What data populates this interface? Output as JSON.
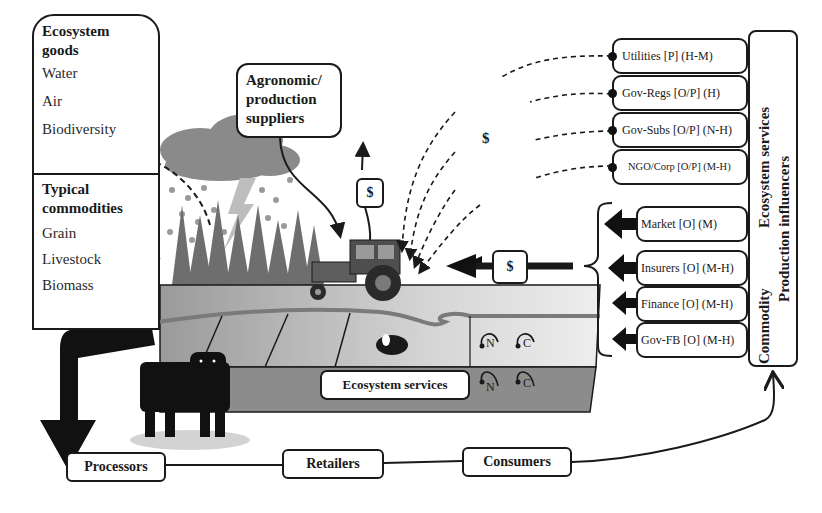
{
  "ecosystem_goods": {
    "title_line1": "Ecosystem",
    "title_line2": "goods",
    "items": [
      "Water",
      "Air",
      "Biodiversity"
    ]
  },
  "typical_commodities": {
    "title_line1": "Typical",
    "title_line2": "commodities",
    "items": [
      "Grain",
      "Livestock",
      "Biomass"
    ]
  },
  "agronomic_suppliers": {
    "line1": "Agronomic/",
    "line2": "production",
    "line3": "suppliers"
  },
  "payment_labels": {
    "supplier_payment": "$",
    "influencer_payment": "$",
    "commodity_payment": "$"
  },
  "ecosystem_service_influencers": [
    {
      "label": "Utilities [P] (H-M)"
    },
    {
      "label": "Gov-Regs [O/P] (H)"
    },
    {
      "label": "Gov-Subs [O/P] (N-H)"
    },
    {
      "label": "NGO/Corp [O/P] (M-H)"
    }
  ],
  "commodity_influencers": [
    {
      "label": "Market [O] (M)"
    },
    {
      "label": "Insurers [O] (M-H)"
    },
    {
      "label": "Finance [O] (M-H)"
    },
    {
      "label": "Gov-FB [O] (M-H)"
    }
  ],
  "side_labels": {
    "ecosystem_services": "Ecosystem services",
    "commodity": "Commodity",
    "production_influencers": "Production influencers"
  },
  "field": {
    "ecosystem_services_label": "Ecosystem services",
    "cycles": [
      "N",
      "C",
      "N",
      "C"
    ]
  },
  "supply_chain": {
    "processors": "Processors",
    "retailers": "Retailers",
    "consumers": "Consumers"
  },
  "colors": {
    "line": "#1a1a1a",
    "field_light": "#d6d6d6",
    "field_dark": "#8c8c8c",
    "vegetation": "#6e6e6e",
    "cloud": "#8a8a8a"
  }
}
